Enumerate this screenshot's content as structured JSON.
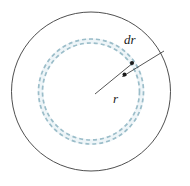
{
  "figure": {
    "name": "annulus-radius-differential-diagram",
    "canvas": {
      "width": 190,
      "height": 186,
      "background": "#ffffff"
    },
    "center": {
      "x": 91,
      "y": 91.5
    },
    "outer_circle": {
      "label": "outer boundary circle",
      "radius": 79.5,
      "stroke": "#3b3b3b",
      "stroke_width": 0.9,
      "style": "solid",
      "fill": "none"
    },
    "ring": {
      "label": "differential annulus",
      "inner_radius": 48.5,
      "outer_radius": 52.5,
      "stroke": "#9bbdc9",
      "stroke_width": 1.6,
      "style": "dashed",
      "dash_pattern": "4 3",
      "band_fill": "#eef5f8"
    },
    "radius_line": {
      "label": "radius leader line",
      "from": {
        "x": 95,
        "y": 94
      },
      "to": {
        "x": 133,
        "y": 56
      },
      "stroke": "#2b2b2b",
      "stroke_width": 0.8
    },
    "thickness_leader": {
      "label": "dr thickness leader line with arrowheads",
      "from": {
        "x": 163,
        "y": 52
      },
      "to": {
        "x": 124,
        "y": 75
      },
      "stroke": "#2b2b2b",
      "stroke_width": 0.8
    },
    "labels": {
      "dr": {
        "text": "dr",
        "x": 131,
        "y": 43
      },
      "r": {
        "text": "r",
        "x": 117,
        "y": 100
      }
    },
    "markers": {
      "inner_point": {
        "x": 124.5,
        "y": 74.5
      },
      "outer_point": {
        "x": 131.5,
        "y": 63.5
      },
      "color": "#1a1a1a",
      "radius": 2.0
    }
  }
}
